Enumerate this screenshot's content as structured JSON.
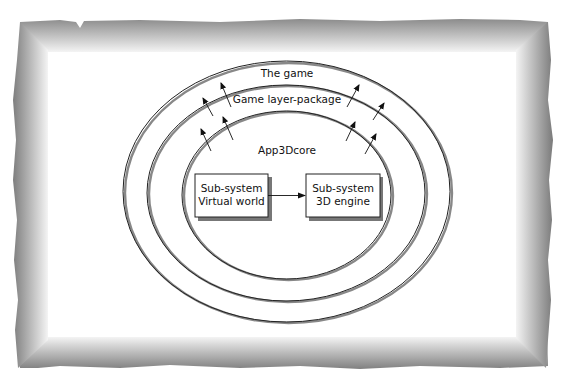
{
  "diagram": {
    "type": "nested-layers",
    "frame": {
      "style": "torn-paper-gray-gradient-border",
      "inner_color": "#ffffff",
      "edge_color": "#8a8a8a"
    },
    "layers": [
      {
        "id": "outer",
        "label": "The game"
      },
      {
        "id": "middle",
        "label": "Game layer-package"
      },
      {
        "id": "inner",
        "label": "App3Dcore"
      }
    ],
    "boxes": [
      {
        "id": "virtual-world",
        "line1": "Sub-system",
        "line2": "Virtual world"
      },
      {
        "id": "engine-3d",
        "line1": "Sub-system",
        "line2": "3D engine"
      }
    ],
    "connections": [
      {
        "from": "virtual-world",
        "to": "engine-3d",
        "style": "arrow"
      }
    ],
    "outward_arrows": {
      "count": 8,
      "meaning": "layer dependency pointing outward"
    },
    "colors": {
      "line": "#222222",
      "shadow": "#777777",
      "box_fill": "#ffffff"
    }
  }
}
